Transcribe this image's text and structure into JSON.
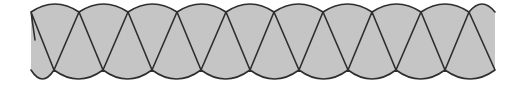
{
  "figure": {
    "colors": {
      "fill": "#c6c6c6",
      "stroke": "#2e2e2e",
      "background": "#ffffff"
    },
    "geometry": {
      "left_x": 31,
      "right_x": 495,
      "top_y": 12,
      "bottom_y": 70,
      "top_arc_peak_y": 4,
      "bottom_arc_low_y": 79,
      "top_vertices_x": [
        31,
        79,
        128,
        177,
        226,
        274,
        323,
        372,
        421,
        469
      ],
      "bottom_vertices_x": [
        54,
        103,
        152,
        201,
        250,
        299,
        348,
        396,
        445
      ],
      "stroke_width": 1.6
    }
  }
}
